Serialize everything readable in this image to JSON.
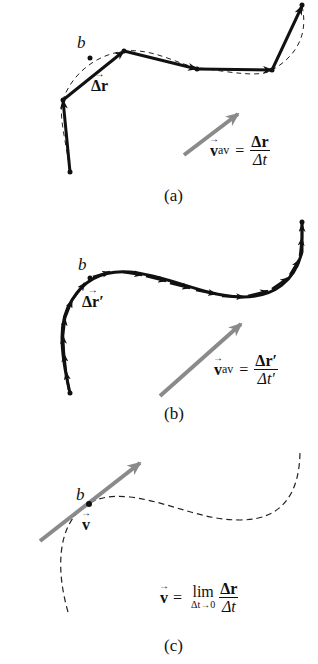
{
  "panels": [
    {
      "id": "a",
      "caption": "(a)",
      "point_label": "b",
      "displacement_label": "Δr",
      "equation": {
        "lhs": "v",
        "lhs_sub": "av",
        "equals": "=",
        "numerator": "Δr",
        "denominator": "Δt"
      }
    },
    {
      "id": "b",
      "caption": "(b)",
      "point_label": "b",
      "displacement_label": "Δr′",
      "equation": {
        "lhs": "v",
        "lhs_sub": "av",
        "equals": "=",
        "numerator": "Δr′",
        "denominator": "Δt′"
      }
    },
    {
      "id": "c",
      "caption": "(c)",
      "point_label": "b",
      "velocity_label": "v",
      "equation": {
        "lhs": "v",
        "equals": "=",
        "lim": "lim",
        "lim_under": "Δt→0",
        "numerator": "Δr",
        "denominator": "Δt"
      }
    }
  ],
  "colors": {
    "path": "#111111",
    "velocity_arrow": "#8a8a8a",
    "dashed_curve": "#222222"
  }
}
